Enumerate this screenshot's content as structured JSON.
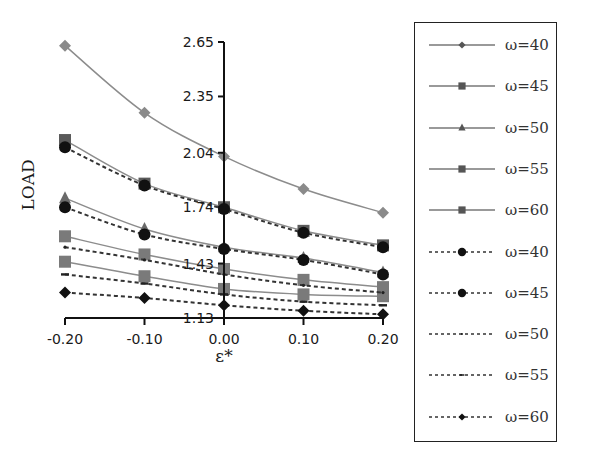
{
  "chart_data": {
    "type": "line",
    "title": "",
    "xlabel": "ε*",
    "ylabel": "LOAD",
    "x": [
      -0.2,
      -0.1,
      0.0,
      0.1,
      0.2
    ],
    "x_tick_labels": [
      "-0.20",
      "-0.10",
      "0.00",
      "0.10",
      "0.20"
    ],
    "y_tick_labels": [
      "2.65",
      "2.35",
      "2.04",
      "1.74",
      "1.43",
      "1.13"
    ],
    "y_ticks": [
      2.65,
      2.35,
      2.04,
      1.74,
      1.43,
      1.13
    ],
    "ylim": [
      1.13,
      2.65
    ],
    "xlim": [
      -0.2,
      0.2
    ],
    "grid": false,
    "legend_position": "right",
    "y_axis_crosses_at_x": 0.0,
    "series": [
      {
        "name": "ω=40",
        "style": "solid",
        "marker": "diamond",
        "color": "#8a8a8a",
        "values": [
          2.63,
          2.26,
          2.02,
          1.84,
          1.71
        ]
      },
      {
        "name": "ω=45",
        "style": "solid",
        "marker": "square",
        "color": "#5a5a5a",
        "values": [
          2.11,
          1.87,
          1.74,
          1.61,
          1.53
        ]
      },
      {
        "name": "ω=50",
        "style": "solid",
        "marker": "triangle",
        "color": "#6a6a6a",
        "values": [
          1.79,
          1.62,
          1.52,
          1.46,
          1.38
        ]
      },
      {
        "name": "ω=55",
        "style": "solid",
        "marker": "square",
        "color": "#7a7a7a",
        "values": [
          1.58,
          1.48,
          1.4,
          1.34,
          1.3
        ]
      },
      {
        "name": "ω=60",
        "style": "solid",
        "marker": "square-x",
        "color": "#7a7a7a",
        "values": [
          1.44,
          1.36,
          1.29,
          1.26,
          1.25
        ]
      },
      {
        "name": "ω=40",
        "style": "dashed",
        "marker": "circle",
        "color": "#111111",
        "values": [
          2.07,
          1.86,
          1.73,
          1.6,
          1.52
        ]
      },
      {
        "name": "ω=45",
        "style": "dashed",
        "marker": "circle",
        "color": "#111111",
        "values": [
          1.74,
          1.59,
          1.51,
          1.45,
          1.37
        ]
      },
      {
        "name": "ω=50",
        "style": "dashed",
        "marker": "dot",
        "color": "#222222",
        "values": [
          1.52,
          1.45,
          1.37,
          1.31,
          1.27
        ]
      },
      {
        "name": "ω=55",
        "style": "dashed",
        "marker": "dash",
        "color": "#222222",
        "values": [
          1.37,
          1.32,
          1.26,
          1.22,
          1.2
        ]
      },
      {
        "name": "ω=60",
        "style": "dashed",
        "marker": "diamond",
        "color": "#111111",
        "values": [
          1.27,
          1.24,
          1.2,
          1.17,
          1.15
        ]
      }
    ]
  },
  "legend": {
    "items": [
      {
        "label": "ω=40",
        "style": "solid",
        "marker": "diamond"
      },
      {
        "label": "ω=45",
        "style": "solid",
        "marker": "square"
      },
      {
        "label": "ω=50",
        "style": "solid",
        "marker": "triangle"
      },
      {
        "label": "ω=55",
        "style": "solid",
        "marker": "square"
      },
      {
        "label": "ω=60",
        "style": "solid",
        "marker": "square-x"
      },
      {
        "label": "ω=40",
        "style": "dashed",
        "marker": "circle"
      },
      {
        "label": "ω=45",
        "style": "dashed",
        "marker": "circle"
      },
      {
        "label": "ω=50",
        "style": "dashed",
        "marker": "dot"
      },
      {
        "label": "ω=55",
        "style": "dashed",
        "marker": "dash"
      },
      {
        "label": "ω=60",
        "style": "dashed",
        "marker": "diamond"
      }
    ]
  }
}
